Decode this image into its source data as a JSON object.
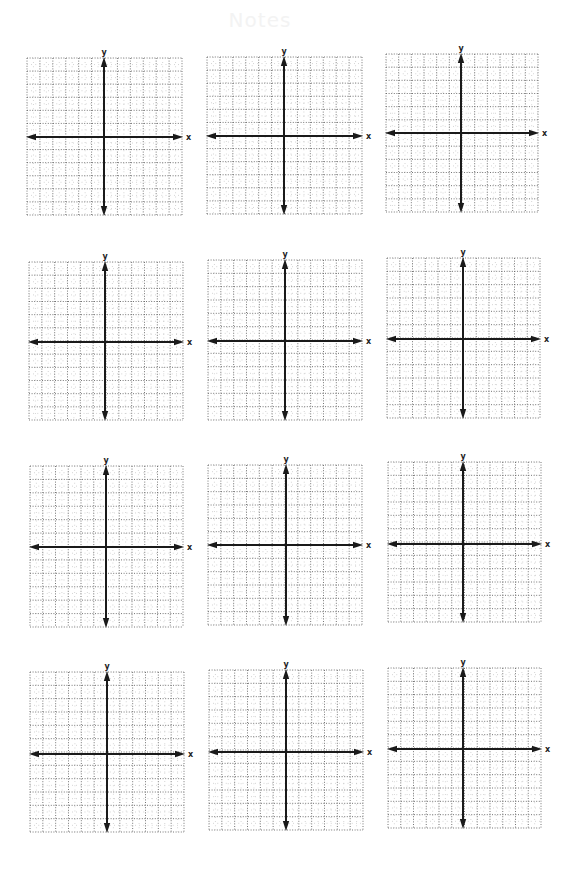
{
  "page": {
    "ghost_title": "Notes",
    "background": "#ffffff",
    "grid_color": "#666666",
    "axis_color": "#1a1a1a",
    "cells_per_side": 12
  },
  "axis_labels": {
    "x": "x",
    "y": "y"
  },
  "panels": [
    {
      "row": 1,
      "col": 1,
      "left": 27,
      "top": 58,
      "width": 155,
      "height": 157,
      "y_axis_x": 104,
      "x_axis_y": 137
    },
    {
      "row": 1,
      "col": 2,
      "left": 207,
      "top": 57,
      "width": 155,
      "height": 157,
      "y_axis_x": 284,
      "x_axis_y": 136
    },
    {
      "row": 1,
      "col": 3,
      "left": 386,
      "top": 54,
      "width": 152,
      "height": 158,
      "y_axis_x": 461,
      "x_axis_y": 133
    },
    {
      "row": 2,
      "col": 1,
      "left": 29,
      "top": 262,
      "width": 154,
      "height": 158,
      "y_axis_x": 105,
      "x_axis_y": 342
    },
    {
      "row": 2,
      "col": 2,
      "left": 208,
      "top": 260,
      "width": 154,
      "height": 160,
      "y_axis_x": 285,
      "x_axis_y": 341
    },
    {
      "row": 2,
      "col": 3,
      "left": 387,
      "top": 258,
      "width": 153,
      "height": 160,
      "y_axis_x": 463,
      "x_axis_y": 339
    },
    {
      "row": 3,
      "col": 1,
      "left": 30,
      "top": 466,
      "width": 153,
      "height": 161,
      "y_axis_x": 106,
      "x_axis_y": 547
    },
    {
      "row": 3,
      "col": 2,
      "left": 208,
      "top": 465,
      "width": 154,
      "height": 160,
      "y_axis_x": 286,
      "x_axis_y": 545
    },
    {
      "row": 3,
      "col": 3,
      "left": 388,
      "top": 462,
      "width": 153,
      "height": 160,
      "y_axis_x": 463,
      "x_axis_y": 544
    },
    {
      "row": 4,
      "col": 1,
      "left": 30,
      "top": 672,
      "width": 154,
      "height": 160,
      "y_axis_x": 107,
      "x_axis_y": 754
    },
    {
      "row": 4,
      "col": 2,
      "left": 209,
      "top": 670,
      "width": 154,
      "height": 160,
      "y_axis_x": 286,
      "x_axis_y": 752
    },
    {
      "row": 4,
      "col": 3,
      "left": 388,
      "top": 668,
      "width": 153,
      "height": 160,
      "y_axis_x": 463,
      "x_axis_y": 749
    }
  ]
}
